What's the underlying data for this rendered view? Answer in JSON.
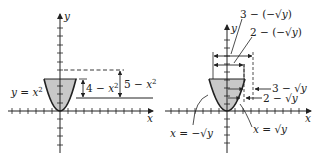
{
  "figure": {
    "panel_left": {
      "axis_labels": {
        "x": "x",
        "y": "y"
      },
      "curve_label": {
        "lhs": "y = x",
        "exp": "2"
      },
      "dim_inner": {
        "text": "4 − x",
        "exp": "2"
      },
      "dim_outer": {
        "text": "5 − x",
        "exp": "2"
      }
    },
    "panel_right": {
      "axis_labels": {
        "x": "x",
        "y": "y"
      },
      "top_label_1": "3 − (−√y)",
      "top_label_2": "2 − (−√y)",
      "right_label_1": "3 − √y",
      "right_label_2": "2 − √y",
      "curve_left_label": "x = −√y",
      "curve_right_label": "x = √y"
    },
    "colors": {
      "ink": "#222222",
      "shade": "#c8c8c8"
    }
  }
}
